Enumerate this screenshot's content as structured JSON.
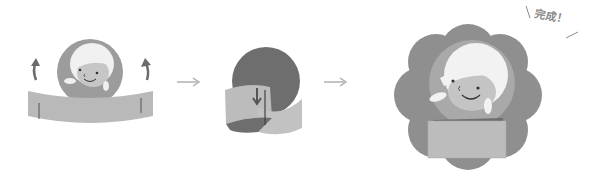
{
  "diagram": {
    "steps": [
      {
        "id": "step-1",
        "description": "Face circle with band, curl band ends up"
      },
      {
        "id": "step-2",
        "description": "Slot band ends together behind circle"
      },
      {
        "id": "step-3",
        "description": "Completed flower-shaped crown with face"
      }
    ],
    "complete_label": "完成！",
    "colors": {
      "background": "#ffffff",
      "band": "#b9b9b9",
      "band_dark": "#a9a9a9",
      "circle": "#9c9c9c",
      "circle_dark": "#6e6e6e",
      "flower": "#8f8f8f",
      "hair": "#f2f2f2",
      "skin": "#c4c4c4",
      "arrow": "#b0b0b0",
      "curl_arrow": "#6a6a6a"
    }
  }
}
